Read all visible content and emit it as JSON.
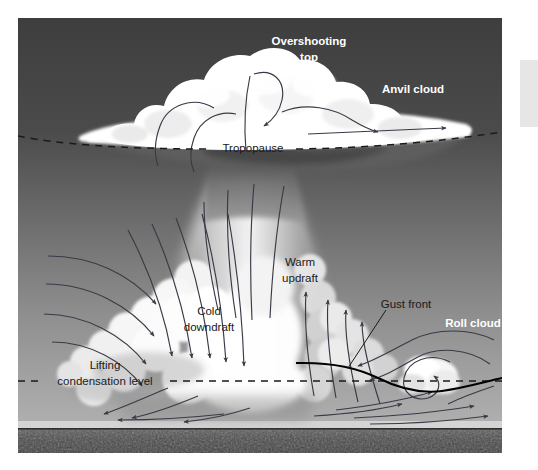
{
  "figure": {
    "colors": {
      "sky_top": "#434343",
      "sky_bottom": "#ababab",
      "cloud": "#ffffff",
      "ground": "#4a4a4a",
      "horizon_band": "#d8d8d8",
      "arrow": "#3a3a47",
      "gust_front_line": "#000000",
      "label_light": "#ffffff",
      "label_dark": "#1a1a1a",
      "side_block": "#e6e6e6"
    },
    "labels": {
      "overshooting_top_line1": "Overshooting",
      "overshooting_top_line2": "top",
      "anvil_cloud": "Anvil cloud",
      "tropopause": "Tropopause",
      "warm_updraft_line1": "Warm",
      "warm_updraft_line2": "updraft",
      "cold_downdraft_line1": "Cold",
      "cold_downdraft_line2": "downdraft",
      "gust_front": "Gust front",
      "roll_cloud": "Roll cloud",
      "lifting_line1": "Lifting",
      "lifting_line2": "condensation level"
    },
    "reference_lines": [
      {
        "name": "tropopause",
        "style": "dashed",
        "color": "#1a1a1a"
      },
      {
        "name": "lifting-condensation-level",
        "style": "dashed",
        "color": "#1a1a1a"
      },
      {
        "name": "gust-front",
        "style": "solid",
        "color": "#000000"
      }
    ]
  }
}
